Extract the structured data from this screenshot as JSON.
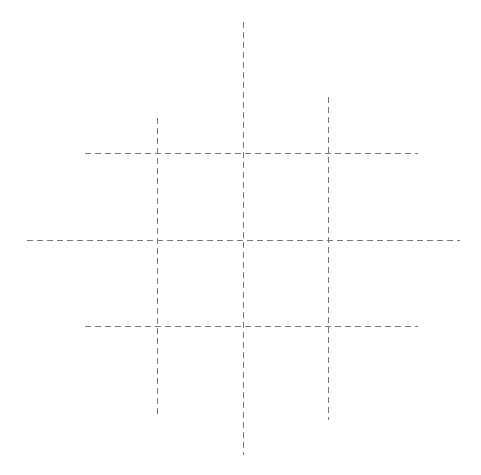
{
  "canvas": {
    "width": 481,
    "height": 475,
    "background": "#ffffff"
  },
  "style": {
    "stroke": "#777777",
    "stroke_width": 1,
    "dasharray": "6 4"
  },
  "lines": {
    "vertical": [
      {
        "id": "v-left",
        "x": 157,
        "y1": 118,
        "y2": 417
      },
      {
        "id": "v-center",
        "x": 243,
        "y1": 22,
        "y2": 455
      },
      {
        "id": "v-right",
        "x": 328,
        "y1": 97,
        "y2": 420
      }
    ],
    "horizontal": [
      {
        "id": "h-top",
        "y": 153,
        "x1": 85,
        "x2": 418
      },
      {
        "id": "h-middle",
        "y": 240,
        "x1": 27,
        "x2": 460
      },
      {
        "id": "h-bottom",
        "y": 326,
        "x1": 85,
        "x2": 418
      }
    ]
  }
}
